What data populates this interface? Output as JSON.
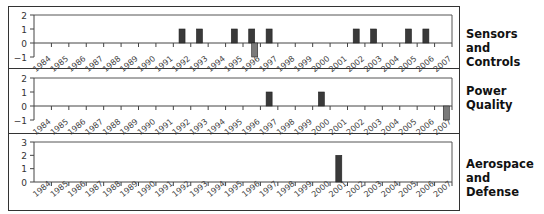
{
  "chart_data": [
    {
      "type": "bar",
      "title": "Sensors and Controls",
      "categories": [
        "1984",
        "1985",
        "1986",
        "1987",
        "1988",
        "1989",
        "1990",
        "1991",
        "1992",
        "1993",
        "1994",
        "1995",
        "1996",
        "1997",
        "1998",
        "1999",
        "2000",
        "2001",
        "2002",
        "2003",
        "2004",
        "2005",
        "2006",
        "2007"
      ],
      "series": [
        {
          "name": "positive",
          "color": "#3a3a3a",
          "values": [
            0,
            0,
            0,
            0,
            0,
            0,
            0,
            0,
            1,
            1,
            0,
            1,
            1,
            1,
            0,
            0,
            0,
            0,
            1,
            1,
            0,
            1,
            1,
            0
          ]
        },
        {
          "name": "negative",
          "color": "#7a7a7a",
          "values": [
            0,
            0,
            0,
            0,
            0,
            0,
            0,
            0,
            0,
            0,
            0,
            0,
            -1,
            0,
            0,
            0,
            0,
            0,
            0,
            0,
            0,
            0,
            0,
            0
          ]
        }
      ],
      "ylim": [
        -1,
        2
      ],
      "yticks": [
        -1,
        0,
        1,
        2
      ],
      "xlabel": "",
      "ylabel": "",
      "grid": false
    },
    {
      "type": "bar",
      "title": "Power Quality",
      "categories": [
        "1984",
        "1985",
        "1986",
        "1987",
        "1988",
        "1989",
        "1990",
        "1991",
        "1992",
        "1993",
        "1994",
        "1995",
        "1996",
        "1997",
        "1998",
        "1999",
        "2000",
        "2001",
        "2002",
        "2003",
        "2004",
        "2005",
        "2006",
        "2007"
      ],
      "series": [
        {
          "name": "positive",
          "color": "#3a3a3a",
          "values": [
            0,
            0,
            0,
            0,
            0,
            0,
            0,
            0,
            0,
            0,
            0,
            0,
            0,
            1,
            0,
            0,
            1,
            0,
            0,
            0,
            0,
            0,
            0,
            0
          ]
        },
        {
          "name": "negative",
          "color": "#7a7a7a",
          "values": [
            0,
            0,
            0,
            0,
            0,
            0,
            0,
            0,
            0,
            0,
            0,
            0,
            0,
            0,
            0,
            0,
            0,
            0,
            0,
            0,
            0,
            0,
            0,
            -1
          ]
        }
      ],
      "ylim": [
        -1,
        2
      ],
      "yticks": [
        -1,
        0,
        1,
        2
      ],
      "xlabel": "",
      "ylabel": "",
      "grid": false
    },
    {
      "type": "bar",
      "title": "Aerospace and Defense",
      "categories": [
        "1984",
        "1985",
        "1986",
        "1987",
        "1988",
        "1989",
        "1990",
        "1991",
        "1992",
        "1993",
        "1994",
        "1995",
        "1996",
        "1997",
        "1998",
        "1999",
        "2000",
        "2001",
        "2002",
        "2003",
        "2004",
        "2005",
        "2006",
        "2007"
      ],
      "series": [
        {
          "name": "positive",
          "color": "#3a3a3a",
          "values": [
            0,
            0,
            0,
            0,
            0,
            0,
            0,
            0,
            0,
            0,
            0,
            0,
            0,
            0,
            0,
            0,
            0,
            2,
            0,
            0,
            0,
            0,
            0,
            0
          ]
        }
      ],
      "ylim": [
        0,
        3
      ],
      "yticks": [
        0,
        1,
        2,
        3
      ],
      "xlabel": "",
      "ylabel": "",
      "grid": false
    }
  ],
  "panels": [
    {
      "label_line1": "Sensors and",
      "label_line2": "Controls"
    },
    {
      "label_line1": "Power Quality",
      "label_line2": ""
    },
    {
      "label_line1": "Aerospace",
      "label_line2": "and Defense"
    }
  ]
}
